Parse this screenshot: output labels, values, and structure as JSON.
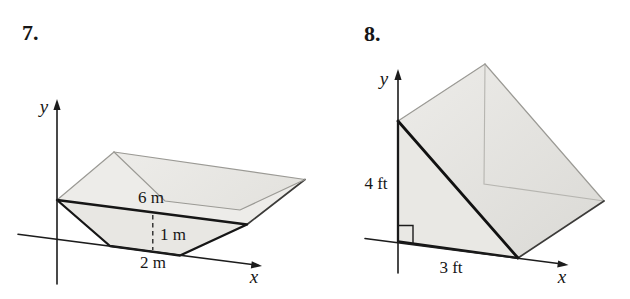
{
  "colors": {
    "background": "#ffffff",
    "ink": "#161616",
    "face_base": "#e8e7e3",
    "face_front": "#e9e8e4",
    "face_light": "#edece9",
    "face_mid": "#e4e3df",
    "face_shadow": "#dbdad6",
    "edge_soft": "#9b9a95",
    "edge_faint": "#b6b5b0"
  },
  "problems": [
    {
      "number": "7.",
      "axes": {
        "x_label": "x",
        "y_label": "y"
      },
      "dimension_labels": {
        "top_width": "6 m",
        "depth": "1 m",
        "bottom_width": "2 m"
      }
    },
    {
      "number": "8.",
      "axes": {
        "x_label": "x",
        "y_label": "y"
      },
      "dimension_labels": {
        "height": "4 ft",
        "base": "3 ft"
      }
    }
  ]
}
